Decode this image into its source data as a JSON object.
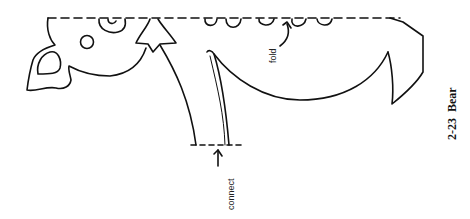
{
  "figure": {
    "caption_number": "2-23",
    "caption_title": "Bear",
    "labels": {
      "fold": "fold",
      "connect": "connect"
    },
    "colors": {
      "background": "#ffffff",
      "line": "#111111"
    }
  }
}
